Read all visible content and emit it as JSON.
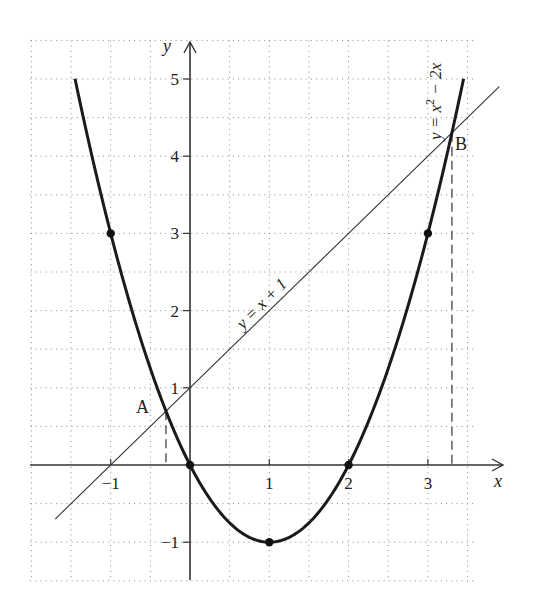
{
  "chart_data": {
    "type": "line",
    "title": "",
    "xlabel": "x",
    "ylabel": "y",
    "xlim": [
      -2,
      3.6
    ],
    "ylim": [
      -1.5,
      5.5
    ],
    "grid": true,
    "grid_step": 0.5,
    "x_ticks": [
      -1,
      1,
      2,
      3
    ],
    "x_tick_labels": [
      "−1",
      "1",
      "2",
      "3"
    ],
    "y_ticks": [
      -1,
      1,
      2,
      3,
      4,
      5
    ],
    "y_tick_labels": [
      "−1",
      "1",
      "2",
      "3",
      "4",
      "5"
    ],
    "series": [
      {
        "name": "y = x² − 2x",
        "kind": "parabola",
        "coefficients": {
          "a": 1,
          "b": -2,
          "c": 0
        },
        "x_range": [
          -1.45,
          3.45
        ],
        "style": "thick",
        "marked_points": [
          {
            "x": -1,
            "y": 3
          },
          {
            "x": 0,
            "y": 0
          },
          {
            "x": 1,
            "y": -1
          },
          {
            "x": 2,
            "y": 0
          },
          {
            "x": 3,
            "y": 3
          }
        ]
      },
      {
        "name": "y = x + 1",
        "kind": "line",
        "slope": 1,
        "intercept": 1,
        "x_range": [
          -1.7,
          3.9
        ],
        "style": "thin"
      }
    ],
    "intersections": [
      {
        "label": "A",
        "x": -0.303,
        "y": 0.697,
        "projection": "dashed-to-x-axis"
      },
      {
        "label": "B",
        "x": 3.303,
        "y": 4.303,
        "projection": "dashed-to-x-axis"
      }
    ],
    "annotations": [
      {
        "text": "y = x + 1",
        "rotated": -45,
        "near": {
          "x": 0.75,
          "y": 1.9
        }
      },
      {
        "text": "y = x² − 2x",
        "rotated": -90,
        "near": {
          "x": 3.05,
          "y": 5.0
        }
      }
    ]
  },
  "labels": {
    "x_axis": "x",
    "y_axis": "y",
    "point_a": "A",
    "point_b": "B",
    "line_eq": "y = x + 1",
    "parabola_eq_prefix": "y = x",
    "parabola_eq_sup": "2",
    "parabola_eq_suffix": " − 2x"
  }
}
